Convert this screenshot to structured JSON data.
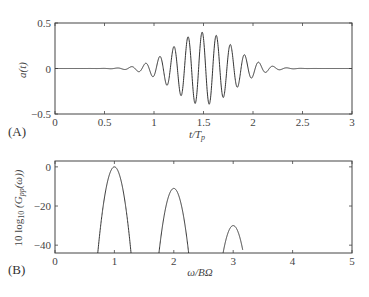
{
  "chart_data": [
    {
      "type": "line",
      "panel_label": "(A)",
      "xlabel": "t/T_p",
      "ylabel": "a(t)",
      "xlim": [
        0,
        3
      ],
      "ylim": [
        -0.5,
        0.5
      ],
      "xticks": [
        "0",
        "0.5",
        "1",
        "1.5",
        "2",
        "2.5",
        "3"
      ],
      "yticks": [
        "0.5",
        "0",
        "−0.5"
      ],
      "grid": false,
      "description": "Gaussian-windowed oscillation centered at t/T_p≈1.5, peak amplitude ≈0.4, ~7 cycles per unit, negligible outside 0.4–2.6",
      "series": [
        {
          "name": "a(t)",
          "envelope_center": 1.5,
          "envelope_peak": 0.4,
          "frequency_cycles_per_unit": 7.0
        }
      ]
    },
    {
      "type": "line",
      "panel_label": "(B)",
      "xlabel": "ω/BΩ",
      "ylabel": "10 log10 (Gpp(ω))",
      "xlim": [
        0,
        5
      ],
      "ylim": [
        -44,
        3
      ],
      "xticks": [
        "0",
        "1",
        "2",
        "3",
        "4",
        "5"
      ],
      "yticks": [
        "0",
        "−20",
        "−40"
      ],
      "grid": false,
      "series": [
        {
          "name": "lobe 1",
          "center": 1,
          "peak_db": 0,
          "x_range": [
            0.72,
            1.28
          ]
        },
        {
          "name": "lobe 2",
          "center": 2,
          "peak_db": -11,
          "x_range": [
            1.75,
            2.25
          ]
        },
        {
          "name": "lobe 3",
          "center": 3,
          "peak_db": -30,
          "x_range": [
            2.83,
            3.16
          ]
        }
      ]
    }
  ],
  "labels": {
    "a_panel": "(A)",
    "b_panel": "(B)",
    "a_ylabel": "a(t)",
    "a_xlabel": "t/T",
    "a_xlabel_sub": "p",
    "b_ylabel_pre": "10 log",
    "b_ylabel_sub": "10",
    "b_ylabel_mid": " (G",
    "b_ylabel_sub2": "pp",
    "b_ylabel_post": "(ω))",
    "b_xlabel": "ω/BΩ"
  }
}
